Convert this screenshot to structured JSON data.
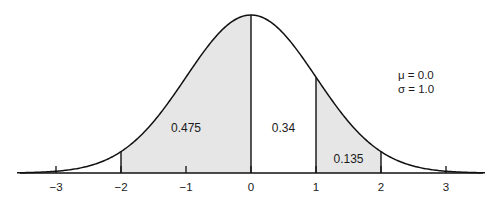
{
  "chart_data": {
    "type": "area",
    "title": "",
    "xlabel": "",
    "ylabel": "",
    "distribution": "standard normal",
    "params": {
      "mu_label": "μ = 0.0",
      "sigma_label": "σ = 1.0",
      "mu": 0.0,
      "sigma": 1.0
    },
    "x_ticks": [
      -3,
      -2,
      -1,
      0,
      1,
      2,
      3
    ],
    "x_tick_labels": [
      "−3",
      "−2",
      "−1",
      "0",
      "1",
      "2",
      "3"
    ],
    "xlim": [
      -3.6,
      3.6
    ],
    "grid": false,
    "regions": [
      {
        "from": -2,
        "to": 0,
        "shaded": true,
        "label": "0.475",
        "value": 0.475
      },
      {
        "from": 0,
        "to": 1,
        "shaded": false,
        "label": "0.34",
        "value": 0.34
      },
      {
        "from": 1,
        "to": 2,
        "shaded": true,
        "label": "0.135",
        "value": 0.135
      }
    ],
    "vertical_lines_at": [
      -2,
      0,
      1,
      2
    ],
    "colors": {
      "shade": "#e6e6e6",
      "line": "#111111"
    }
  }
}
